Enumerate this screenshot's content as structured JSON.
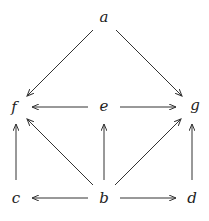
{
  "diagram": {
    "type": "directed-graph",
    "nodes": [
      {
        "id": "a",
        "label": "a",
        "x": 104,
        "y": 22
      },
      {
        "id": "f",
        "label": "f",
        "x": 14,
        "y": 111
      },
      {
        "id": "e",
        "label": "e",
        "x": 104,
        "y": 111
      },
      {
        "id": "g",
        "label": "g",
        "x": 195,
        "y": 111
      },
      {
        "id": "c",
        "label": "c",
        "x": 16,
        "y": 202
      },
      {
        "id": "b",
        "label": "b",
        "x": 104,
        "y": 202
      },
      {
        "id": "d",
        "label": "d",
        "x": 192,
        "y": 202
      }
    ],
    "edges": [
      {
        "from": "a",
        "to": "f"
      },
      {
        "from": "a",
        "to": "g"
      },
      {
        "from": "e",
        "to": "f"
      },
      {
        "from": "e",
        "to": "g"
      },
      {
        "from": "c",
        "to": "f"
      },
      {
        "from": "b",
        "to": "f"
      },
      {
        "from": "b",
        "to": "e"
      },
      {
        "from": "b",
        "to": "g"
      },
      {
        "from": "d",
        "to": "g"
      },
      {
        "from": "b",
        "to": "c"
      },
      {
        "from": "b",
        "to": "d"
      }
    ]
  }
}
